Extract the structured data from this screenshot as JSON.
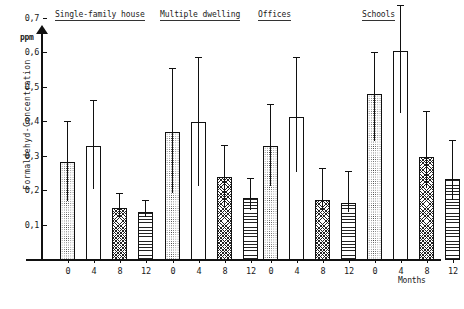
{
  "axis": {
    "unit": "ppm",
    "y_title": "Formaldehyd-Concentration",
    "y_ticks": [
      "0,7",
      "0,6",
      "0,5",
      "0,4",
      "0,3",
      "0,2",
      "0,1"
    ],
    "x_title": "Months",
    "x_ticks": [
      "0",
      "4",
      "8",
      "12"
    ]
  },
  "groups": [
    {
      "title": "Single-family house"
    },
    {
      "title": "Multiple dwelling"
    },
    {
      "title": "Offices"
    },
    {
      "title": "Schools"
    }
  ],
  "chart_data": {
    "type": "bar",
    "title": "",
    "xlabel": "Months",
    "ylabel": "Formaldehyd-Concentration",
    "yunit": "ppm",
    "ylim": [
      0,
      0.75
    ],
    "grid": false,
    "legend": "none",
    "categories": [
      "0",
      "4",
      "8",
      "12"
    ],
    "fill_patterns": [
      "dots",
      "empty",
      "cross-hatch",
      "horizontal-lines"
    ],
    "groups": [
      {
        "name": "Single-family house",
        "values": [
          0.285,
          0.33,
          0.15,
          0.14
        ],
        "err_high": [
          0.4,
          0.46,
          0.19,
          0.17
        ],
        "err_low": [
          0.17,
          0.205,
          0.125,
          0.125
        ]
      },
      {
        "name": "Multiple dwelling",
        "values": [
          0.37,
          0.4,
          0.24,
          0.18
        ],
        "err_high": [
          0.555,
          0.585,
          0.33,
          0.235
        ],
        "err_low": [
          0.195,
          0.215,
          0.155,
          0.145
        ]
      },
      {
        "name": "Offices",
        "values": [
          0.33,
          0.415,
          0.175,
          0.165
        ],
        "err_high": [
          0.45,
          0.585,
          0.265,
          0.255
        ],
        "err_low": [
          0.215,
          0.255,
          0.145,
          0.14
        ]
      },
      {
        "name": "Schools",
        "values": [
          0.48,
          0.605,
          0.3,
          0.235
        ],
        "err_high": [
          0.6,
          0.735,
          0.43,
          0.345
        ],
        "err_low": [
          0.345,
          0.425,
          0.21,
          0.175
        ]
      }
    ]
  }
}
